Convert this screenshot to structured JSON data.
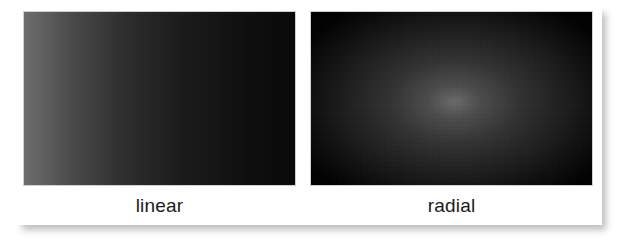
{
  "figure": {
    "background_color": "#ffffff",
    "card_background": "#ffffff"
  },
  "swatches": [
    {
      "id": "linear",
      "caption": "linear",
      "gradient_type": "linear",
      "direction": "left-to-right",
      "start_color": "#6e6e6e",
      "end_color": "#070707",
      "stops": [
        {
          "offset": "0%",
          "color": "#6e6e6e"
        },
        {
          "offset": "18%",
          "color": "#494949"
        },
        {
          "offset": "37%",
          "color": "#2d2d2d"
        },
        {
          "offset": "58%",
          "color": "#1a1a1a"
        },
        {
          "offset": "82%",
          "color": "#0d0d0d"
        },
        {
          "offset": "100%",
          "color": "#070707"
        }
      ]
    },
    {
      "id": "radial",
      "caption": "radial",
      "gradient_type": "radial",
      "center": "51% 52%",
      "start_color": "#6a6a6a",
      "end_color": "#000000",
      "stops": [
        {
          "offset": "0%",
          "color": "#6a6a6a"
        },
        {
          "offset": "15%",
          "color": "#4c4c4c"
        },
        {
          "offset": "36%",
          "color": "#333333"
        },
        {
          "offset": "58%",
          "color": "#212121"
        },
        {
          "offset": "79%",
          "color": "#101010"
        },
        {
          "offset": "100%",
          "color": "#000000"
        }
      ]
    }
  ]
}
